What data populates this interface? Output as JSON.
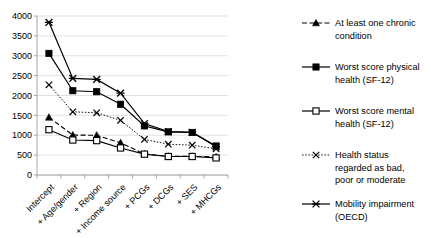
{
  "chart_data": {
    "type": "line",
    "title": "",
    "xlabel": "",
    "ylabel": "",
    "ylim": [
      0,
      4000
    ],
    "ytick_step": 500,
    "grid": true,
    "legend_position": "right",
    "categories": [
      "Intercept",
      "+ Age/gender",
      "+ Region",
      "+ Income source",
      "+ PCGs",
      "+ DCGs",
      "+ SES",
      "+ MHCGs"
    ],
    "yticks": [
      "0",
      "500",
      "1000",
      "1500",
      "2000",
      "2500",
      "3000",
      "3500",
      "4000"
    ],
    "series": [
      {
        "name": "At least one chronic condition",
        "marker": "triangle",
        "dash": "dashed",
        "values": [
          1450,
          1005,
          1000,
          810,
          530,
          470,
          470,
          455
        ]
      },
      {
        "name": "Worst score physical health (SF-12)",
        "marker": "square-filled",
        "dash": "solid",
        "values": [
          3060,
          2120,
          2095,
          1780,
          1235,
          1085,
          1070,
          730
        ]
      },
      {
        "name": "Worst score mental health (SF-12)",
        "marker": "square-open",
        "dash": "solid",
        "values": [
          1140,
          880,
          865,
          680,
          525,
          465,
          465,
          430
        ]
      },
      {
        "name": "Health status regarded as bad, poor or moderate",
        "marker": "x",
        "dash": "dotted",
        "values": [
          2270,
          1590,
          1565,
          1375,
          895,
          775,
          750,
          660
        ]
      },
      {
        "name": "Mobility impairment (OECD)",
        "marker": "star",
        "dash": "solid",
        "values": [
          3840,
          2430,
          2405,
          2060,
          1295,
          1090,
          1075,
          710
        ]
      }
    ]
  },
  "legend": {
    "entries": [
      {
        "label_line1": "At least one chronic",
        "label_line2": "condition"
      },
      {
        "label_line1": "Worst score physical",
        "label_line2": "health (SF-12)"
      },
      {
        "label_line1": "Worst score mental",
        "label_line2": "health (SF-12)"
      },
      {
        "label_line1": "Health status",
        "label_line2": "regarded as bad,",
        "label_line3": "poor or moderate"
      },
      {
        "label_line1": "Mobility impairment",
        "label_line2": "(OECD)"
      }
    ]
  },
  "colors": {
    "ink": "#000000",
    "grid": "#d9d9d9",
    "axis": "#9c9c9c",
    "background": "#ffffff"
  }
}
